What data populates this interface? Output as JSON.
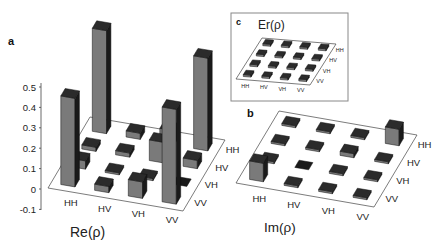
{
  "figure": {
    "panels": [
      {
        "letter": "a",
        "title": "Re(ρ)"
      },
      {
        "letter": "b",
        "title": "Im(ρ)"
      },
      {
        "letter": "c",
        "title": "Er(ρ)"
      }
    ]
  },
  "chart_data": [
    {
      "type": "bar3d",
      "panel": "a",
      "title": "Re(ρ)",
      "x_categories": [
        "HH",
        "HV",
        "VH",
        "VV"
      ],
      "y_categories": [
        "HH",
        "HV",
        "VH",
        "VV"
      ],
      "zlim": [
        -0.1,
        0.5
      ],
      "z_ticks": [
        "0.5",
        "0.4",
        "0.3",
        "0.2",
        "0.1",
        "0",
        "-0.1"
      ],
      "values": [
        [
          0.5,
          0.03,
          0.07,
          0.45
        ],
        [
          0.02,
          0.02,
          0.1,
          0.04
        ],
        [
          0.04,
          0.01,
          0.01,
          -0.01
        ],
        [
          0.43,
          0.03,
          0.08,
          0.46
        ]
      ],
      "note": "Rows = first (row) basis index HH..VV, columns = second index HH..VV; estimated heights"
    },
    {
      "type": "bar3d",
      "panel": "b",
      "title": "Im(ρ)",
      "x_categories": [
        "HH",
        "HV",
        "VH",
        "VV"
      ],
      "y_categories": [
        "HH",
        "HV",
        "VH",
        "VV"
      ],
      "zlim": [
        -0.1,
        0.5
      ],
      "values": [
        [
          0.0,
          0.0,
          0.0,
          0.08
        ],
        [
          0.0,
          0.0,
          0.02,
          0.0
        ],
        [
          0.0,
          -0.01,
          0.0,
          0.0
        ],
        [
          0.09,
          0.0,
          0.0,
          0.0
        ]
      ],
      "note": "Mostly near-zero imaginary parts; estimated heights"
    },
    {
      "type": "bar3d",
      "panel": "c",
      "title": "Er(ρ)",
      "x_categories": [
        "HH",
        "HV",
        "VH",
        "VV"
      ],
      "y_categories": [
        "HH",
        "HV",
        "VH",
        "VV"
      ],
      "values": [
        [
          0.01,
          0.01,
          0.01,
          0.01
        ],
        [
          0.01,
          0.01,
          0.01,
          0.01
        ],
        [
          0.01,
          0.01,
          0.01,
          0.01
        ],
        [
          0.01,
          0.01,
          0.01,
          0.01
        ]
      ],
      "note": "Uniform small error bars (inset)"
    }
  ],
  "axis_labels": {
    "a_x": [
      "HH",
      "HV",
      "VH",
      "VV"
    ],
    "a_y": [
      "HH",
      "HV",
      "VH",
      "VV"
    ],
    "b_x": [
      "HH",
      "HV",
      "VH",
      "VV"
    ],
    "b_y": [
      "HH",
      "HV",
      "VH",
      "VV"
    ],
    "c_x": [
      "HH",
      "HV",
      "VH",
      "VV"
    ],
    "c_y": [
      "HH",
      "HV",
      "VH",
      "VV"
    ],
    "a_z": [
      "0.5",
      "0.4",
      "0.3",
      "0.2",
      "0.1",
      "0",
      "-0.1"
    ]
  },
  "colors": {
    "bar_side": "#6f6f6f",
    "bar_top": "#2b2b2b",
    "bar_dark": "#1a1a1a",
    "bar_front": "#7a7a7a",
    "axis": "#444444",
    "text": "#222222"
  }
}
